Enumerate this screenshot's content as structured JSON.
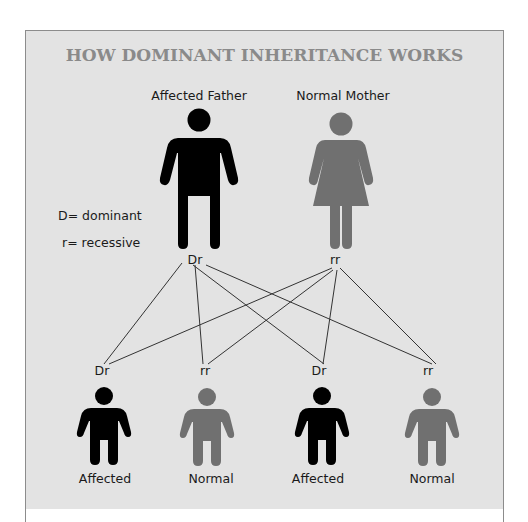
{
  "title": "HOW DOMINANT INHERITANCE WORKS",
  "legend": {
    "dominant": "D= dominant",
    "recessive": "r= recessive"
  },
  "parents": [
    {
      "label": "Affected Father",
      "genotype": "Dr",
      "status": "affected",
      "color": "#000000"
    },
    {
      "label": "Normal Mother",
      "genotype": "rr",
      "status": "normal",
      "color": "#707070"
    }
  ],
  "children": [
    {
      "genotype": "Dr",
      "label": "Affected",
      "color": "#000000"
    },
    {
      "genotype": "rr",
      "label": "Normal",
      "color": "#707070"
    },
    {
      "genotype": "Dr",
      "label": "Affected",
      "color": "#000000"
    },
    {
      "genotype": "rr",
      "label": "Normal",
      "color": "#707070"
    }
  ],
  "colors": {
    "panel_bg": "#e3e3e3",
    "title": "#8a8a8a",
    "affected": "#000000",
    "normal": "#707070",
    "line": "#333333"
  }
}
